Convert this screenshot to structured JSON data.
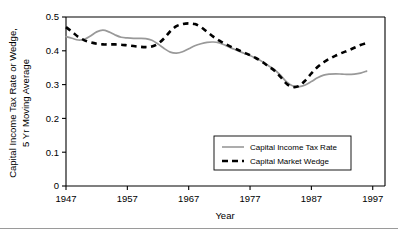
{
  "figure": {
    "name": "capital-income-tax-rate-and-market-wedge-chart",
    "background_color": "#ffffff"
  },
  "chart_data": {
    "type": "line",
    "title": "",
    "xlabel": "Year",
    "ylabel": "Capital Income Tax Rate or Wedge,\n5 Yr Moving Average",
    "ylabel_line1": "Capital Income Tax Rate or Wedge,",
    "ylabel_line2": "5 Yr Moving Average",
    "xlim": [
      1947,
      1999
    ],
    "ylim": [
      0,
      0.5
    ],
    "xticks": [
      1947,
      1957,
      1967,
      1977,
      1987,
      1997
    ],
    "xtick_labels": [
      "1947",
      "1957",
      "1967",
      "1977",
      "1987",
      "1997"
    ],
    "yticks": [
      0,
      0.1,
      0.2,
      0.3,
      0.4,
      0.5
    ],
    "ytick_labels": [
      "0",
      "0.1",
      "0.2",
      "0.3",
      "0.4",
      "0.5"
    ],
    "grid": false,
    "legend_position": "center-right",
    "x": [
      1947,
      1948,
      1949,
      1950,
      1951,
      1952,
      1953,
      1954,
      1955,
      1956,
      1957,
      1958,
      1959,
      1960,
      1961,
      1962,
      1963,
      1964,
      1965,
      1966,
      1967,
      1968,
      1969,
      1970,
      1971,
      1972,
      1973,
      1974,
      1975,
      1976,
      1977,
      1978,
      1979,
      1980,
      1981,
      1982,
      1983,
      1984,
      1985,
      1986,
      1987,
      1988,
      1989,
      1990,
      1991,
      1992,
      1993,
      1994,
      1995,
      1996
    ],
    "series": [
      {
        "name": "Capital Income Tax Rate",
        "style": "solid",
        "color": "#999999",
        "values": [
          0.442,
          0.437,
          0.432,
          0.434,
          0.444,
          0.456,
          0.461,
          0.456,
          0.447,
          0.44,
          0.438,
          0.437,
          0.437,
          0.436,
          0.431,
          0.42,
          0.407,
          0.396,
          0.393,
          0.397,
          0.406,
          0.415,
          0.421,
          0.425,
          0.426,
          0.423,
          0.416,
          0.408,
          0.4,
          0.393,
          0.386,
          0.378,
          0.368,
          0.356,
          0.344,
          0.327,
          0.307,
          0.296,
          0.294,
          0.299,
          0.309,
          0.32,
          0.328,
          0.331,
          0.332,
          0.331,
          0.33,
          0.331,
          0.334,
          0.34
        ]
      },
      {
        "name": "Capital Market Wedge",
        "style": "dashed",
        "color": "#000000",
        "values": [
          0.47,
          0.456,
          0.441,
          0.431,
          0.425,
          0.421,
          0.419,
          0.419,
          0.419,
          0.418,
          0.416,
          0.414,
          0.412,
          0.411,
          0.413,
          0.421,
          0.437,
          0.458,
          0.473,
          0.479,
          0.481,
          0.479,
          0.47,
          0.456,
          0.442,
          0.43,
          0.42,
          0.411,
          0.403,
          0.395,
          0.387,
          0.378,
          0.367,
          0.354,
          0.341,
          0.322,
          0.302,
          0.293,
          0.296,
          0.312,
          0.333,
          0.352,
          0.366,
          0.377,
          0.386,
          0.394,
          0.401,
          0.409,
          0.417,
          0.423
        ]
      }
    ],
    "legend": [
      {
        "label": "Capital Income Tax Rate",
        "style": "solid",
        "color": "#999999"
      },
      {
        "label": "Capital Market Wedge",
        "style": "dashed",
        "color": "#000000"
      }
    ]
  }
}
